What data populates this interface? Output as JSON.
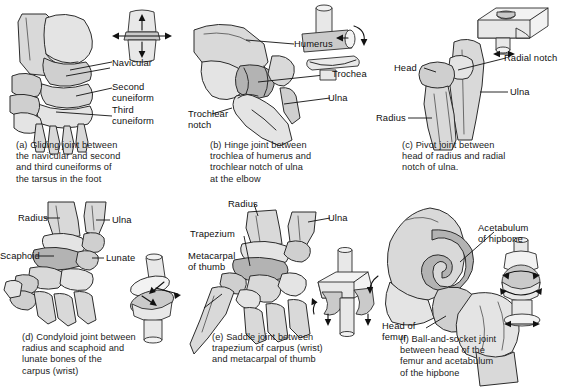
{
  "figure": {
    "panel_count": 6,
    "bottom_cut_text": "                                                                                  ",
    "colors": {
      "bone_fill": "#d9d9d9",
      "bone_outline": "#2b2b2b",
      "cartilage_fill": "#b3b3b3",
      "mechanical_model_fill": "#e8e8e8",
      "background": "#ffffff",
      "text": "#1a1a1a"
    }
  },
  "panels": [
    {
      "letter": "(a)",
      "joint_type": "Gliding joint",
      "caption": "(a) Gliding joint between\nthe navicular and second\nand third cuneiforms of\nthe tarsus in the foot",
      "region": "tarsus of the foot",
      "labels": [
        {
          "text": "Navicular",
          "bone": "navicular"
        },
        {
          "text": "Second\ncuneiform",
          "bone": "second-cuneiform"
        },
        {
          "text": "Third\ncuneiform",
          "bone": "third-cuneiform"
        }
      ],
      "model": {
        "name": "gliding-model",
        "description": "two flat plates sliding across one another",
        "motion": "multidirectional gliding",
        "arrows": [
          "up",
          "down",
          "left",
          "right"
        ]
      }
    },
    {
      "letter": "(b)",
      "joint_type": "Hinge joint",
      "caption": "(b) Hinge joint between\ntrochlea of humerus and\ntrochlear notch of ulna\nat the elbow",
      "region": "elbow",
      "labels": [
        {
          "text": "Humerus",
          "bone": "humerus"
        },
        {
          "text": "Trochea",
          "bone": "trochlea"
        },
        {
          "text": "Ulna",
          "bone": "ulna"
        },
        {
          "text": "Trochlear\nnotch",
          "bone": "trochlear-notch"
        }
      ],
      "model": {
        "name": "hinge-model",
        "description": "cylinder seated in a curved trough",
        "motion": "flexion and extension in one plane",
        "arrows": [
          "rotational"
        ]
      }
    },
    {
      "letter": "(c)",
      "joint_type": "Pivot joint",
      "caption": "(c) Pivot joint between\nhead of radius and radial\nnotch of ulna.",
      "region": "proximal radioulnar joint",
      "labels": [
        {
          "text": "Head",
          "bone": "head-of-radius"
        },
        {
          "text": "Radial notch",
          "bone": "radial-notch"
        },
        {
          "text": "Ulna",
          "bone": "ulna"
        },
        {
          "text": "Radius",
          "bone": "radius"
        }
      ],
      "model": {
        "name": "pivot-model",
        "description": "peg rotating within a collar in a block",
        "motion": "rotation about a single axis",
        "arrows": [
          "rotational"
        ]
      }
    },
    {
      "letter": "(d)",
      "joint_type": "Condyloid joint",
      "caption": "(d) Condyloid joint between\nradius and scaphoid and\nlunate bones of the\ncarpus (wrist)",
      "region": "wrist",
      "labels": [
        {
          "text": "Radius",
          "bone": "radius"
        },
        {
          "text": "Ulna",
          "bone": "ulna"
        },
        {
          "text": "Scaphoid",
          "bone": "scaphoid"
        },
        {
          "text": "Lunate",
          "bone": "lunate"
        }
      ],
      "model": {
        "name": "condyloid-model",
        "description": "oval condyle seated in an elliptical cavity",
        "motion": "biaxial; flexion-extension and abduction-adduction",
        "arrows": [
          "two-axis"
        ]
      }
    },
    {
      "letter": "(e)",
      "joint_type": "Saddle joint",
      "caption": "(e) Saddle joint between\ntrapezium of carpus (wrist)\nand metacarpal of thumb",
      "region": "base of the thumb",
      "labels": [
        {
          "text": "Radius",
          "bone": "radius"
        },
        {
          "text": "Ulna",
          "bone": "ulna"
        },
        {
          "text": "Trapezium",
          "bone": "trapezium"
        },
        {
          "text": "Metacarpal\nof thumb",
          "bone": "first-metacarpal"
        }
      ],
      "model": {
        "name": "saddle-model",
        "description": "two interlocking saddle-shaped surfaces",
        "motion": "biaxial with opposition",
        "arrows": [
          "two-axis"
        ]
      }
    },
    {
      "letter": "(f)",
      "joint_type": "Ball-and-socket joint",
      "caption": "(f) Ball-and-socket joint\nbetween head of the\nfemur and acetabulum\nof the hipbone",
      "region": "hip",
      "labels": [
        {
          "text": "Acetabulum\nof hipbone",
          "bone": "acetabulum"
        },
        {
          "text": "Head of\nfemur",
          "bone": "head-of-femur"
        }
      ],
      "model": {
        "name": "ball-and-socket-model",
        "description": "spherical head captured in a cup",
        "motion": "multiaxial; rotation in all planes",
        "arrows": [
          "multi-axis"
        ]
      }
    }
  ]
}
